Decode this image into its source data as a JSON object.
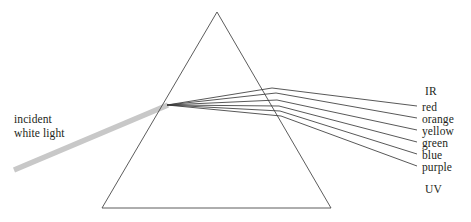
{
  "figure": {
    "background_color": "#ffffff",
    "line_color": "#3a3a3a",
    "prism_outline_color": "#4a4a4a",
    "beam_color": "#c8c8c8",
    "text_color": "#231f20"
  },
  "incident": {
    "label_line1": "incident",
    "label_line2": "white light",
    "beam_start": [
      14,
      170
    ],
    "beam_end": [
      167,
      105
    ],
    "beam_width_px": 5
  },
  "prism": {
    "name": "triangular-prism",
    "apex": [
      217,
      12
    ],
    "base_left": [
      102,
      208
    ],
    "base_right": [
      331,
      208
    ],
    "stroke_width": 0.9
  },
  "refraction": {
    "entry_point": [
      167,
      105
    ],
    "exit_points": [
      [
        272,
        88
      ],
      [
        276,
        93
      ],
      [
        277,
        100
      ],
      [
        279,
        106
      ],
      [
        280,
        111
      ],
      [
        281,
        116
      ]
    ]
  },
  "spectrum": {
    "labels": [
      {
        "name": "IR",
        "text": "IR",
        "has_ray": false
      },
      {
        "name": "red",
        "text": "red",
        "has_ray": true,
        "ray_end": [
          417,
          106
        ]
      },
      {
        "name": "orange",
        "text": "orange",
        "has_ray": true,
        "ray_end": [
          417,
          118
        ]
      },
      {
        "name": "yellow",
        "text": "yellow",
        "has_ray": true,
        "ray_end": [
          417,
          130
        ]
      },
      {
        "name": "green",
        "text": "green",
        "has_ray": true,
        "ray_end": [
          417,
          142
        ]
      },
      {
        "name": "blue",
        "text": "blue",
        "has_ray": true,
        "ray_end": [
          417,
          154
        ]
      },
      {
        "name": "purple",
        "text": "purple",
        "has_ray": true,
        "ray_end": [
          417,
          166
        ]
      },
      {
        "name": "UV",
        "text": "UV",
        "has_ray": false
      }
    ]
  }
}
